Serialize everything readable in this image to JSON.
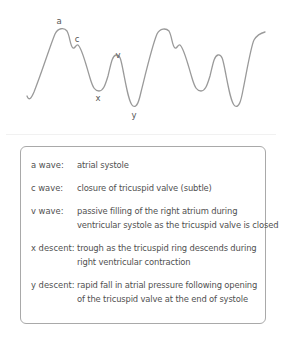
{
  "diagram": {
    "type": "jugular venous pressure waveform",
    "stroke_color": "#9a9a9a",
    "waveform_labels": [
      {
        "id": "a",
        "text": "a",
        "x": 59,
        "y": 17
      },
      {
        "id": "c",
        "text": "c",
        "x": 77,
        "y": 35
      },
      {
        "id": "v",
        "text": "v",
        "x": 118,
        "y": 51
      },
      {
        "id": "x",
        "text": "x",
        "x": 98,
        "y": 94
      },
      {
        "id": "y",
        "text": "y",
        "x": 134,
        "y": 111
      }
    ]
  },
  "legend": {
    "border_color": "#a9a9a9",
    "items": [
      {
        "term": "a wave:",
        "lines": [
          "atrial systole"
        ]
      },
      {
        "term": "c wave:",
        "lines": [
          "closure of tricuspid valve (subtle)"
        ]
      },
      {
        "term": "v wave:",
        "lines": [
          "passive filling of the right atrium during",
          "ventricular systole as the tricuspid valve is closed"
        ]
      },
      {
        "term": "x descent:",
        "lines": [
          "trough as the tricuspid ring descends during",
          "right ventricular contraction"
        ]
      },
      {
        "term": "y descent:",
        "lines": [
          "rapid fall in atrial pressure following opening",
          "of the tricuspid valve at the end of systole"
        ]
      }
    ]
  }
}
